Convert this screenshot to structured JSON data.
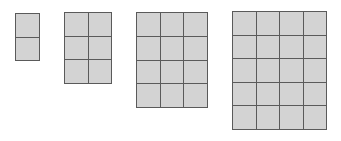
{
  "diagram": {
    "title": "",
    "colors": {
      "fill": "#d3d3d3",
      "line": "#5a5a5a",
      "background": "#ffffff"
    },
    "grids": [
      {
        "cols": 1,
        "rows": 2,
        "x": 15,
        "y": 13,
        "w": 25,
        "h": 48
      },
      {
        "cols": 2,
        "rows": 3,
        "x": 64,
        "y": 12,
        "w": 48,
        "h": 72
      },
      {
        "cols": 3,
        "rows": 4,
        "x": 136,
        "y": 12,
        "w": 72,
        "h": 96
      },
      {
        "cols": 4,
        "rows": 5,
        "x": 232,
        "y": 11,
        "w": 95,
        "h": 119
      }
    ]
  }
}
